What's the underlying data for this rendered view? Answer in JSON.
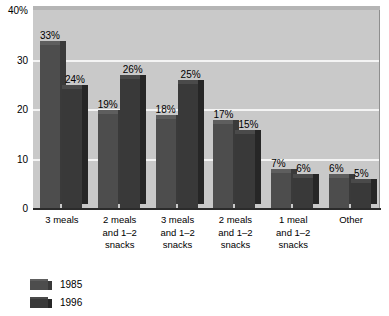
{
  "chart_data": {
    "type": "bar",
    "title": "",
    "xlabel": "",
    "ylabel": "",
    "ylim": [
      0,
      40
    ],
    "grid": true,
    "legend_position": "bottom-left",
    "categories": [
      "3 meals",
      "2 meals\nand 1–2\nsnacks",
      "3 meals\nand 1–2\nsnacks",
      "2 meals\nand 1–2\nsnacks",
      "1 meal\nand 1–2\nsnacks",
      "Other"
    ],
    "series": [
      {
        "name": "1985",
        "values": [
          33,
          19,
          18,
          17,
          7,
          6
        ],
        "color": "#4d4d4d"
      },
      {
        "name": "1996",
        "values": [
          24,
          26,
          25,
          15,
          6,
          5
        ],
        "color": "#393939"
      }
    ],
    "value_labels": [
      [
        "33%",
        "19%",
        "18%",
        "17%",
        "7%",
        "6%"
      ],
      [
        "24%",
        "26%",
        "25%",
        "15%",
        "6%",
        "5%"
      ]
    ],
    "y_ticks": [
      {
        "value": 40,
        "label": "40%"
      },
      {
        "value": 30,
        "label": "30"
      },
      {
        "value": 20,
        "label": "20"
      },
      {
        "value": 10,
        "label": "10"
      },
      {
        "value": 0,
        "label": "0"
      }
    ]
  },
  "legend": {
    "items": [
      {
        "label": "1985"
      },
      {
        "label": "1996"
      }
    ]
  }
}
